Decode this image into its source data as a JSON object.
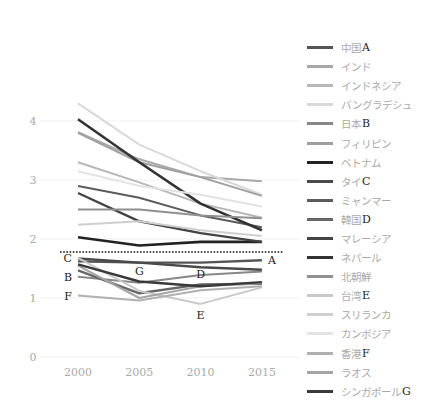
{
  "chart_data": {
    "type": "line",
    "title": "",
    "xlabel": "",
    "ylabel": "",
    "x": [
      2000,
      2005,
      2010,
      2015
    ],
    "y_ticks": [
      0,
      1,
      2,
      3,
      4
    ],
    "ylim": [
      0,
      4.6
    ],
    "grid": true,
    "legend_position": "right",
    "reference_line": {
      "y": 1.78,
      "style": "dotted"
    },
    "series": [
      {
        "name": "中国",
        "letter": "A",
        "color": "#555555",
        "width": 2.4,
        "values": [
          1.62,
          1.6,
          1.6,
          1.64
        ]
      },
      {
        "name": "インド",
        "letter": "",
        "color": "#a9a9a9",
        "width": 2.0,
        "values": [
          3.81,
          3.35,
          3.05,
          2.98
        ]
      },
      {
        "name": "インドネシア",
        "letter": "",
        "color": "#b7b7b7",
        "width": 2.0,
        "values": [
          3.3,
          2.96,
          2.6,
          2.36
        ]
      },
      {
        "name": "バングラデシュ",
        "letter": "",
        "color": "#d9d9d9",
        "width": 2.0,
        "values": [
          4.3,
          3.6,
          3.15,
          2.75
        ]
      },
      {
        "name": "日本",
        "letter": "B",
        "color": "#888888",
        "width": 2.0,
        "values": [
          1.36,
          1.26,
          1.39,
          1.45
        ]
      },
      {
        "name": "フィリピン",
        "letter": "",
        "color": "#9f9f9f",
        "width": 2.0,
        "values": [
          3.8,
          3.3,
          3.05,
          2.73
        ]
      },
      {
        "name": "ベトナム",
        "letter": "",
        "color": "#222222",
        "width": 2.6,
        "values": [
          2.03,
          1.89,
          1.95,
          1.95
        ]
      },
      {
        "name": "タイ",
        "letter": "C",
        "color": "#4a4a4a",
        "width": 2.4,
        "values": [
          1.67,
          1.6,
          1.52,
          1.48
        ]
      },
      {
        "name": "ミャンマー",
        "letter": "",
        "color": "#5c5c5c",
        "width": 2.0,
        "values": [
          2.9,
          2.7,
          2.4,
          2.2
        ]
      },
      {
        "name": "韓国",
        "letter": "D",
        "color": "#666666",
        "width": 2.4,
        "values": [
          1.47,
          1.08,
          1.23,
          1.24
        ]
      },
      {
        "name": "マレーシア",
        "letter": "",
        "color": "#444444",
        "width": 2.4,
        "values": [
          2.78,
          2.3,
          2.1,
          1.95
        ]
      },
      {
        "name": "ネパール",
        "letter": "",
        "color": "#333333",
        "width": 2.6,
        "values": [
          4.03,
          3.3,
          2.6,
          2.15
        ]
      },
      {
        "name": "北朝鮮",
        "letter": "",
        "color": "#909090",
        "width": 2.0,
        "values": [
          2.5,
          2.5,
          2.4,
          2.35
        ]
      },
      {
        "name": "台湾",
        "letter": "E",
        "color": "#c9c9c9",
        "width": 2.0,
        "values": [
          1.68,
          1.12,
          0.9,
          1.18
        ]
      },
      {
        "name": "スリランカ",
        "letter": "",
        "color": "#cfcfcf",
        "width": 2.0,
        "values": [
          2.24,
          2.3,
          2.15,
          2.05
        ]
      },
      {
        "name": "カンボジア",
        "letter": "",
        "color": "#e3e3e3",
        "width": 2.0,
        "values": [
          3.15,
          2.9,
          2.75,
          2.55
        ]
      },
      {
        "name": "香港",
        "letter": "F",
        "color": "#b0b0b0",
        "width": 2.0,
        "values": [
          1.04,
          0.96,
          1.13,
          1.2
        ]
      },
      {
        "name": "ラオス",
        "letter": "",
        "color": "#a5a5a5",
        "width": 2.0,
        "values": [
          1.55,
          1.0,
          1.2,
          1.25
        ]
      },
      {
        "name": "シンガポール",
        "letter": "G",
        "color": "#3a3a3a",
        "width": 2.4,
        "values": [
          1.57,
          1.28,
          1.2,
          1.27
        ]
      }
    ],
    "annotations": [
      {
        "text": "A",
        "x": 2015,
        "y": 1.64,
        "pos": "right"
      },
      {
        "text": "B",
        "x": 2000,
        "y": 1.36,
        "pos": "left"
      },
      {
        "text": "C",
        "x": 2000,
        "y": 1.67,
        "pos": "left"
      },
      {
        "text": "D",
        "x": 2010,
        "y": 1.23,
        "pos": "above"
      },
      {
        "text": "E",
        "x": 2010,
        "y": 0.9,
        "pos": "below"
      },
      {
        "text": "F",
        "x": 2000,
        "y": 1.04,
        "pos": "left"
      },
      {
        "text": "G",
        "x": 2005,
        "y": 1.28,
        "pos": "above"
      }
    ]
  }
}
